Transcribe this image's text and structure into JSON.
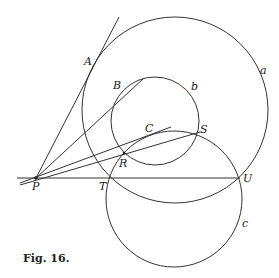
{
  "figure": {
    "caption": "Fig. 16.",
    "labels": {
      "A": "A",
      "B": "B",
      "C": "C",
      "S": "S",
      "R": "R",
      "P": "P",
      "T": "T",
      "U": "U",
      "a": "a",
      "b": "b",
      "c": "c"
    },
    "circles": [
      {
        "name": "a",
        "cx": 175,
        "cy": 110,
        "r": 93
      },
      {
        "name": "b",
        "cx": 155,
        "cy": 121,
        "r": 44
      },
      {
        "name": "c",
        "cx": 174,
        "cy": 199,
        "r": 68
      }
    ],
    "point_P": [
      36,
      178
    ],
    "lines": [
      {
        "name": "PA",
        "from": [
          36,
          178
        ],
        "to": [
          119,
          17
        ]
      },
      {
        "name": "PB",
        "from": [
          36,
          178
        ],
        "to": [
          144,
          78
        ]
      },
      {
        "name": "PC",
        "from": [
          20,
          183
        ],
        "to": [
          171,
          127
        ]
      },
      {
        "name": "PS",
        "from": [
          20,
          184
        ],
        "to": [
          200,
          132
        ]
      },
      {
        "name": "PU",
        "from": [
          17,
          178
        ],
        "to": [
          240,
          178
        ]
      }
    ]
  }
}
